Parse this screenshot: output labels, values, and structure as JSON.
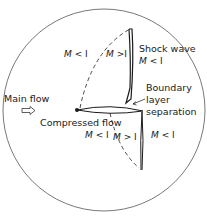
{
  "diagram": {
    "labels": {
      "shock_wave": "Shock wave",
      "boundary_layer_line1": "Boundary",
      "boundary_layer_line2": "layer",
      "boundary_layer_line3": "separation",
      "main_flow": "Main flow",
      "compressed_flow": "Compressed flow"
    },
    "mach_regions": {
      "upper_left": {
        "symbol": "M",
        "relation": "< I"
      },
      "upper_middle": {
        "symbol": "M",
        "relation": ">I"
      },
      "upper_right": {
        "symbol": "M",
        "relation": "< I"
      },
      "lower_left": {
        "symbol": "M",
        "relation": "< I"
      },
      "lower_middle": {
        "symbol": "M",
        "relation": "> I"
      },
      "lower_right": {
        "symbol": "M",
        "relation": "< I"
      }
    },
    "icons": {
      "flow_arrow": "hollow-right-arrow",
      "leading_edge": "filled-dot"
    },
    "colors": {
      "line": "#1a1a1a",
      "circle": "#444444",
      "background": "#ffffff"
    }
  }
}
